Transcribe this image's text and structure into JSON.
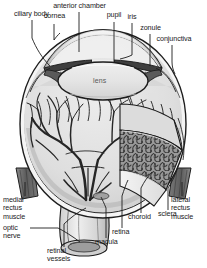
{
  "figure": {
    "background_color": "#ffffff",
    "ink_color": "#1a1a1a",
    "width": 207,
    "height": 268
  },
  "labels": {
    "anterior_chamber": "anterior chamber",
    "cornea": "cornea",
    "pupil": "pupil",
    "iris": "iris",
    "zonule": "zonule",
    "conjunctiva": "conjunctiva",
    "ciliary_body": "ciliary body",
    "lens": "lens",
    "medial_rectus_muscle": "medial\nrectus\nmuscle",
    "optic_nerve": "optic\nnerve",
    "retinal_vessels": "retinal\nvessels",
    "macula": "macula",
    "retina": "retina",
    "choroid": "choroid",
    "sclera": "sclera",
    "lateral_rectus_muscle": "lateral\nrectus\nmuscle"
  },
  "colors": {
    "line": "#1d1d1d",
    "muscle_fill": "#6e6e6e",
    "muscle_dark": "#4a4a4a",
    "vitreous_fill": "#d8d8d8",
    "vitreous_light": "#e6e6e6",
    "lens_fill": "#e3e3e3",
    "choroid_fill": "#8b8b8b",
    "sclera_fill": "#f2f2f2",
    "vessel": "#262626",
    "cornea_shade": "#bdbdbd",
    "iris_dark": "#3a3a3a",
    "text": "#1a1a1a",
    "lens_text": "#5a5a5a"
  }
}
